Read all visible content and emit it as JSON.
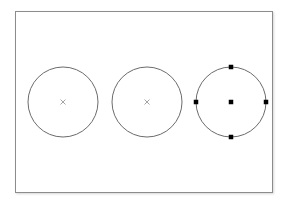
{
  "app": {
    "window_title": "CAD Canvas",
    "background_color": "#ffffff"
  },
  "canvas": {
    "name": "drawing-canvas",
    "x": 15,
    "y": 11,
    "width": 258,
    "height": 182,
    "fill": "#ffffff",
    "border_color": "#8c8c8c",
    "border_width": 1,
    "shadow_color": "rgba(0,0,0,0.16)"
  },
  "geometry": {
    "stroke_color": "#5a5a5a",
    "stroke_width": 0.9,
    "center_marker_color": "#9a9a9a",
    "center_marker_size": 5,
    "grip_color": "#000000",
    "grip_size": 4.5,
    "shapes": [
      {
        "id": "circle-1",
        "type": "circle",
        "cx": 62,
        "cy": 101,
        "r": 35,
        "selected": false,
        "center_marker": "x",
        "grips": []
      },
      {
        "id": "circle-2",
        "type": "circle",
        "cx": 146,
        "cy": 101,
        "r": 35,
        "selected": false,
        "center_marker": "x",
        "grips": []
      },
      {
        "id": "circle-3",
        "type": "circle",
        "cx": 230,
        "cy": 101,
        "r": 35,
        "selected": true,
        "center_marker": "square",
        "grips": [
          {
            "name": "grip-center",
            "x": 230,
            "y": 101
          },
          {
            "name": "grip-top",
            "x": 230,
            "y": 66
          },
          {
            "name": "grip-right",
            "x": 265,
            "y": 101
          },
          {
            "name": "grip-bottom",
            "x": 230,
            "y": 136
          },
          {
            "name": "grip-left",
            "x": 195,
            "y": 101
          }
        ]
      }
    ]
  }
}
